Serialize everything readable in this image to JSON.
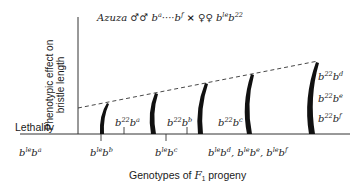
{
  "title": {
    "strain": "Azuza",
    "male_symbol": "♂♂",
    "male_alleles_start": "b",
    "male_alleles_start_sup": "a",
    "ellipsis": "····",
    "male_alleles_end": "b",
    "male_alleles_end_sup": "f",
    "cross": "×",
    "female_symbol": "♀♀",
    "female_genotype_b1": "b",
    "female_genotype_sup1": "le",
    "female_genotype_b2": "b",
    "female_genotype_sup2": "22"
  },
  "axes": {
    "y_label_line1": "Phenotypic effect on",
    "y_label_line2": "bristle length",
    "x_label_prefix": "Genotypes of ",
    "x_label_F": "F",
    "x_label_sub": "1",
    "x_label_suffix": " progeny",
    "baseline_label": "Lethality"
  },
  "upper_labels": [
    {
      "b": "b",
      "sup1": "22",
      "b2": "b",
      "sup2": "a"
    },
    {
      "b": "b",
      "sup1": "22",
      "b2": "b",
      "sup2": "b"
    },
    {
      "b": "b",
      "sup1": "22",
      "b2": "b",
      "sup2": "c"
    },
    {
      "b": "b",
      "sup1": "22",
      "b2": "b",
      "sup2": "d"
    },
    {
      "b": "b",
      "sup1": "22",
      "b2": "b",
      "sup2": "e"
    },
    {
      "b": "b",
      "sup1": "22",
      "b2": "b",
      "sup2": "f"
    }
  ],
  "lower_labels": [
    {
      "b": "b",
      "sup1": "le",
      "b2": "b",
      "sup2": "a"
    },
    {
      "b": "b",
      "sup1": "le",
      "b2": "b",
      "sup2": "b"
    },
    {
      "b": "b",
      "sup1": "le",
      "b2": "b",
      "sup2": "c"
    },
    {
      "b": "b",
      "sup1": "le",
      "b2": "b",
      "sup2": "d"
    },
    {
      "b": "b",
      "sup1": "le",
      "b2": "b",
      "sup2": "e"
    },
    {
      "b": "b",
      "sup1": "le",
      "b2": "b",
      "sup2": "f"
    }
  ],
  "separator": ", ",
  "colors": {
    "ink": "#1a1a1a",
    "dashed": "#333333",
    "background": "#ffffff"
  }
}
